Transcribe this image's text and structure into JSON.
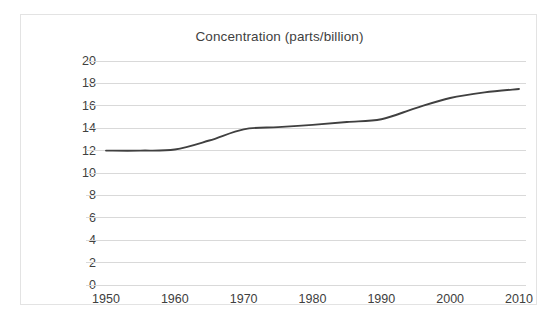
{
  "chart_data": {
    "type": "line",
    "title": "Concentration (parts/billion)",
    "xlabel": "",
    "ylabel": "",
    "xlim": [
      1950,
      2010
    ],
    "ylim": [
      0,
      20
    ],
    "grid": "horizontal",
    "legend": "none",
    "line_color": "#404040",
    "gridline_color": "#d9d9d9",
    "x_ticks": [
      "1950",
      "1960",
      "1970",
      "1980",
      "1990",
      "2000",
      "2010"
    ],
    "y_ticks": [
      "0",
      "2",
      "4",
      "6",
      "8",
      "10",
      "12",
      "14",
      "16",
      "18",
      "20"
    ],
    "series": [
      {
        "name": "Concentration",
        "x": [
          1950,
          1955,
          1960,
          1965,
          1970,
          1975,
          1980,
          1985,
          1990,
          1995,
          2000,
          2005,
          2010
        ],
        "values": [
          12.0,
          12.0,
          12.1,
          12.9,
          13.9,
          14.1,
          14.3,
          14.55,
          14.8,
          15.8,
          16.7,
          17.2,
          17.5
        ]
      }
    ]
  },
  "chart": {
    "title": "Concentration (parts/billion)"
  }
}
